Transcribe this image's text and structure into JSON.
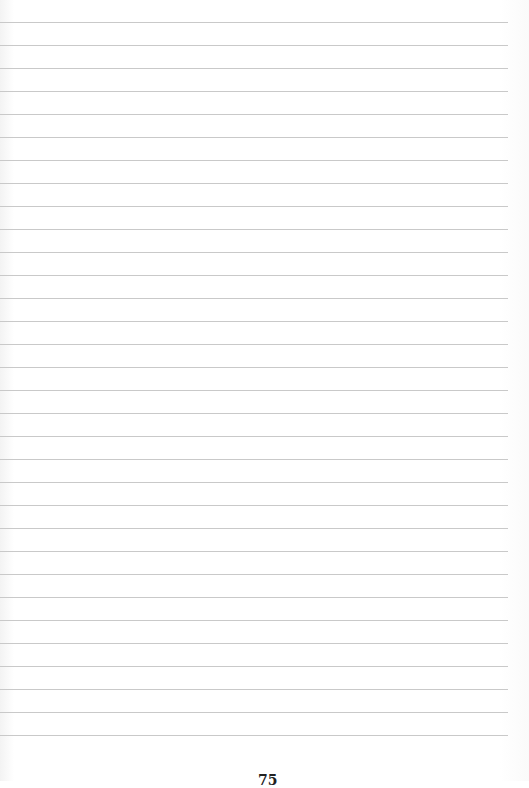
{
  "page": {
    "type": "lined-notebook-page",
    "background_color": "#ffffff",
    "rule_color": "#c9c9c9",
    "rule_count": 32,
    "first_rule_y": 22,
    "rule_spacing": 23,
    "rule_width": 508
  },
  "bleed_through_text": {
    "left": "",
    "right": ""
  },
  "footer": {
    "page_number": "75"
  }
}
